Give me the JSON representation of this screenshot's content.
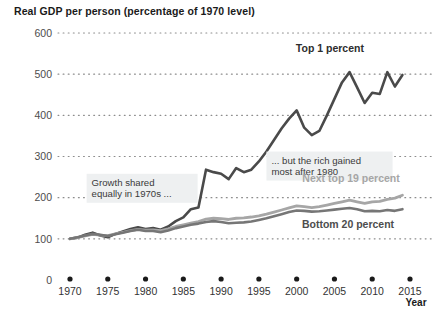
{
  "chart_data": {
    "type": "line",
    "title": "Real GDP per person (percentage of 1970 level)",
    "xlabel": "Year",
    "ylabel": "",
    "xlim": [
      1970,
      2015
    ],
    "ylim": [
      0,
      600
    ],
    "grid": "dotted-horizontal",
    "legend_position": "inline-labels",
    "xticks": [
      1970,
      1975,
      1980,
      1985,
      1990,
      1995,
      2000,
      2005,
      2010,
      2015
    ],
    "xtick_labels": [
      "1970",
      "1975",
      "1980",
      "1985",
      "1990",
      "1995",
      "2000",
      "2005",
      "2010",
      "2015"
    ],
    "yticks": [
      0,
      100,
      200,
      300,
      400,
      500,
      600
    ],
    "ytick_labels": [
      "0",
      "100",
      "200",
      "300",
      "400",
      "500",
      "600"
    ],
    "x": [
      1970,
      1971,
      1972,
      1973,
      1974,
      1975,
      1976,
      1977,
      1978,
      1979,
      1980,
      1981,
      1982,
      1983,
      1984,
      1985,
      1986,
      1987,
      1988,
      1989,
      1990,
      1991,
      1992,
      1993,
      1994,
      1995,
      1996,
      1997,
      1998,
      1999,
      2000,
      2001,
      2002,
      2003,
      2004,
      2005,
      2006,
      2007,
      2008,
      2009,
      2010,
      2011,
      2012,
      2013,
      2014
    ],
    "series": [
      {
        "name": "Top 1 percent",
        "color": "#4a4a4a",
        "width": 2.6,
        "label_color": "#2d2d2d",
        "values": [
          100,
          103,
          110,
          115,
          108,
          104,
          112,
          118,
          124,
          128,
          124,
          126,
          122,
          130,
          143,
          152,
          172,
          176,
          268,
          262,
          258,
          245,
          272,
          262,
          268,
          288,
          312,
          340,
          368,
          392,
          412,
          370,
          352,
          362,
          400,
          440,
          480,
          505,
          468,
          430,
          455,
          452,
          505,
          470,
          498
        ]
      },
      {
        "name": "Next top 19 percent",
        "color": "#a6a6a6",
        "width": 2.8,
        "label_color": "#a6a6a6",
        "values": [
          100,
          103,
          107,
          111,
          109,
          108,
          112,
          116,
          120,
          123,
          121,
          122,
          120,
          124,
          130,
          134,
          138,
          142,
          148,
          150,
          149,
          147,
          150,
          151,
          153,
          156,
          160,
          165,
          170,
          175,
          180,
          178,
          176,
          178,
          182,
          186,
          190,
          194,
          190,
          186,
          190,
          191,
          196,
          199,
          206
        ]
      },
      {
        "name": "Bottom 20 percent",
        "color": "#767676",
        "width": 2.6,
        "label_color": "#4d4d4d",
        "values": [
          100,
          104,
          108,
          112,
          110,
          107,
          111,
          115,
          119,
          122,
          119,
          119,
          116,
          120,
          126,
          130,
          134,
          137,
          141,
          143,
          141,
          138,
          139,
          140,
          142,
          146,
          150,
          155,
          160,
          165,
          169,
          168,
          166,
          167,
          169,
          171,
          173,
          175,
          172,
          167,
          168,
          167,
          170,
          168,
          172
        ]
      }
    ],
    "annotations": [
      {
        "id": "growth-shared",
        "lines": [
          "Growth shared",
          "equally in 1970s ..."
        ],
        "x": 1972.2,
        "y_top": 258,
        "box": true
      },
      {
        "id": "rich-gained",
        "lines": [
          "... but the rich gained",
          "most after 1980"
        ],
        "x": 1996.0,
        "y_top": 312,
        "box": true
      }
    ],
    "series_labels": [
      {
        "text": "Top 1 percent",
        "x": 2004.4,
        "y": 555
      },
      {
        "text": "Next top 19 percent",
        "x": 2007.2,
        "y": 237
      },
      {
        "text": "Bottom 20 percent",
        "x": 2006.8,
        "y": 127
      }
    ]
  }
}
